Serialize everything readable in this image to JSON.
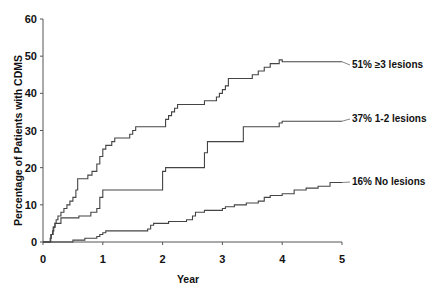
{
  "chart_data": {
    "type": "line",
    "subtype": "step (Kaplan-Meier cumulative incidence)",
    "title": "",
    "xlabel": "Year",
    "ylabel": "Percentage of Patients with CDMS",
    "xlim": [
      0,
      5
    ],
    "ylim": [
      0,
      60
    ],
    "x_ticks": [
      "0",
      "1",
      "2",
      "3",
      "4",
      "5"
    ],
    "y_ticks": [
      "0",
      "10",
      "20",
      "30",
      "40",
      "50",
      "60"
    ],
    "grid": false,
    "legend": "inline labels at right end of each curve",
    "series": [
      {
        "name": "51% ≥3 lesions",
        "label": "51% ≥3 lesions",
        "points": [
          [
            0.0,
            0
          ],
          [
            0.1,
            0
          ],
          [
            0.12,
            1
          ],
          [
            0.14,
            2
          ],
          [
            0.16,
            3
          ],
          [
            0.18,
            4
          ],
          [
            0.2,
            5
          ],
          [
            0.22,
            6
          ],
          [
            0.25,
            7
          ],
          [
            0.3,
            8
          ],
          [
            0.35,
            9
          ],
          [
            0.4,
            10
          ],
          [
            0.45,
            11
          ],
          [
            0.5,
            12
          ],
          [
            0.55,
            14
          ],
          [
            0.58,
            17
          ],
          [
            0.75,
            18
          ],
          [
            0.82,
            19
          ],
          [
            0.9,
            21
          ],
          [
            0.95,
            23
          ],
          [
            1.0,
            25
          ],
          [
            1.05,
            26
          ],
          [
            1.15,
            27
          ],
          [
            1.2,
            28
          ],
          [
            1.45,
            29
          ],
          [
            1.5,
            30
          ],
          [
            1.55,
            31
          ],
          [
            2.0,
            31
          ],
          [
            2.05,
            33
          ],
          [
            2.1,
            34
          ],
          [
            2.15,
            35
          ],
          [
            2.2,
            36
          ],
          [
            2.25,
            37
          ],
          [
            2.7,
            38
          ],
          [
            2.9,
            39
          ],
          [
            2.95,
            40
          ],
          [
            3.0,
            41
          ],
          [
            3.05,
            42
          ],
          [
            3.1,
            44
          ],
          [
            3.5,
            45
          ],
          [
            3.6,
            46
          ],
          [
            3.7,
            47
          ],
          [
            3.8,
            48
          ],
          [
            3.95,
            49
          ],
          [
            4.0,
            48.5
          ],
          [
            5.0,
            48.5
          ]
        ],
        "end_value": 48.5
      },
      {
        "name": "37% 1-2 lesions",
        "label": "37% 1-2 lesions",
        "points": [
          [
            0.0,
            0
          ],
          [
            0.1,
            0
          ],
          [
            0.13,
            2
          ],
          [
            0.17,
            4
          ],
          [
            0.2,
            5
          ],
          [
            0.3,
            6.5
          ],
          [
            0.55,
            6.5
          ],
          [
            0.6,
            7
          ],
          [
            0.8,
            8
          ],
          [
            0.9,
            9
          ],
          [
            0.95,
            12
          ],
          [
            1.0,
            14
          ],
          [
            1.85,
            14
          ],
          [
            2.0,
            19
          ],
          [
            2.05,
            20
          ],
          [
            2.6,
            20
          ],
          [
            2.7,
            24
          ],
          [
            2.75,
            27
          ],
          [
            3.3,
            27
          ],
          [
            3.35,
            31
          ],
          [
            3.9,
            31
          ],
          [
            3.95,
            32
          ],
          [
            4.0,
            32.5
          ],
          [
            5.0,
            32.5
          ]
        ],
        "end_value": 32.5
      },
      {
        "name": "16% No lesions",
        "label": "16% No lesions",
        "points": [
          [
            0.0,
            0
          ],
          [
            0.45,
            0
          ],
          [
            0.5,
            0.5
          ],
          [
            0.7,
            1
          ],
          [
            0.9,
            1.5
          ],
          [
            0.95,
            2
          ],
          [
            1.0,
            2.5
          ],
          [
            1.05,
            3
          ],
          [
            1.6,
            3
          ],
          [
            1.75,
            3.5
          ],
          [
            1.8,
            4.5
          ],
          [
            1.85,
            5
          ],
          [
            2.1,
            5.5
          ],
          [
            2.4,
            6
          ],
          [
            2.5,
            7
          ],
          [
            2.55,
            8
          ],
          [
            2.7,
            8.5
          ],
          [
            3.0,
            9
          ],
          [
            3.05,
            9.5
          ],
          [
            3.2,
            10
          ],
          [
            3.4,
            10.5
          ],
          [
            3.6,
            11
          ],
          [
            3.7,
            12
          ],
          [
            3.8,
            12.5
          ],
          [
            4.0,
            13
          ],
          [
            4.2,
            14
          ],
          [
            4.4,
            14.5
          ],
          [
            4.6,
            15
          ],
          [
            4.8,
            16
          ],
          [
            5.0,
            16
          ]
        ],
        "end_value": 16
      }
    ]
  }
}
